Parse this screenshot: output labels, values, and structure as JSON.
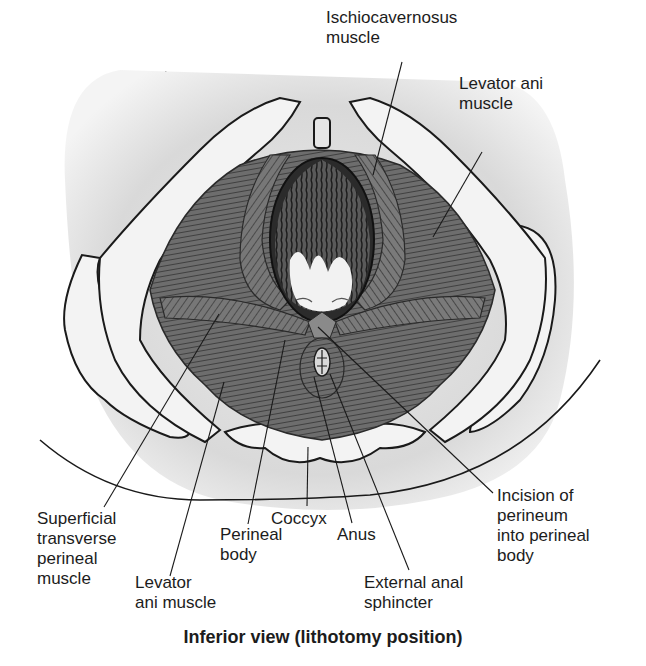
{
  "figure": {
    "caption": "Inferior view (lithotomy position)",
    "corner_fragment": "g  p",
    "labels": [
      {
        "id": "ischiocavernosus",
        "text": "Ischiocavernosus\nmuscle",
        "x": 326,
        "y": 8
      },
      {
        "id": "levator-ani-right",
        "text": "Levator ani\nmuscle",
        "x": 459,
        "y": 74
      },
      {
        "id": "superficial-transverse-perineal",
        "text": "Superficial\ntransverse\nperineal\nmuscle",
        "x": 37,
        "y": 509
      },
      {
        "id": "levator-ani-left",
        "text": "Levator\nani muscle",
        "x": 135,
        "y": 573
      },
      {
        "id": "perineal-body",
        "text": "Perineal\nbody",
        "x": 220,
        "y": 525
      },
      {
        "id": "coccyx",
        "text": "Coccyx",
        "x": 271,
        "y": 509
      },
      {
        "id": "anus",
        "text": "Anus",
        "x": 337,
        "y": 525
      },
      {
        "id": "external-anal-sphincter",
        "text": "External anal\nsphincter",
        "x": 364,
        "y": 573
      },
      {
        "id": "incision-of-perineum",
        "text": "Incision of\nperineum\ninto perineal\nbody",
        "x": 497,
        "y": 486
      }
    ],
    "leader_lines": [
      {
        "label": "ischiocavernosus",
        "x1": 402,
        "y1": 62,
        "x2": 373,
        "y2": 175
      },
      {
        "label": "levator-ani-right",
        "x1": 482,
        "y1": 152,
        "x2": 433,
        "y2": 237
      },
      {
        "label": "superficial-transverse-perineal",
        "x1": 104,
        "y1": 507,
        "x2": 219,
        "y2": 314
      },
      {
        "label": "levator-ani-left",
        "x1": 170,
        "y1": 576,
        "x2": 224,
        "y2": 382
      },
      {
        "label": "perineal-body",
        "x1": 248,
        "y1": 524,
        "x2": 285,
        "y2": 340
      },
      {
        "label": "coccyx",
        "x1": 307,
        "y1": 506,
        "x2": 308,
        "y2": 447
      },
      {
        "label": "anus",
        "x1": 352,
        "y1": 523,
        "x2": 314,
        "y2": 377
      },
      {
        "label": "external-anal-sphincter",
        "x1": 409,
        "y1": 570,
        "x2": 330,
        "y2": 374
      },
      {
        "label": "incision-of-perineum",
        "x1": 493,
        "y1": 493,
        "x2": 318,
        "y2": 327
      }
    ],
    "colors": {
      "background": "#ffffff",
      "ink": "#1a1a1a",
      "bone": "#f2f2f2",
      "shadow": "#d6d6d6",
      "muscle": "#6f6f6f",
      "muscle_dark": "#3e3e3e",
      "hair": "#2a2a2a",
      "skin": "#efefef"
    }
  }
}
